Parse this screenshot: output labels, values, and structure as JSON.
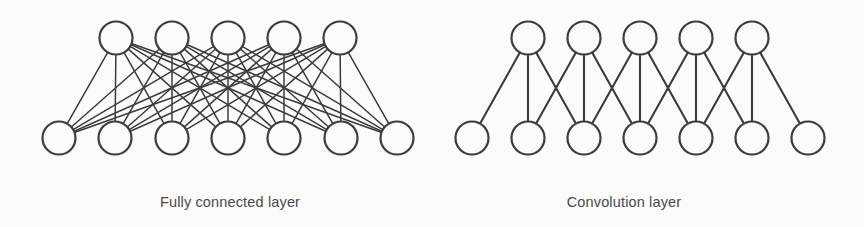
{
  "figure": {
    "background_color": "#fbfbfa",
    "stroke_color": "#3c3c3c",
    "node_fill": "#fbfbfa",
    "caption_color": "#4a4a4a",
    "width": 864,
    "height": 227
  },
  "diagrams": [
    {
      "id": "fully-connected",
      "caption": "Fully connected layer",
      "caption_x": 230,
      "connectivity": "all-to-all",
      "node_radius": 16.5,
      "edge_width": 1.5,
      "top_layer": {
        "count": 5,
        "y": 38,
        "x": [
          116,
          172,
          228,
          284,
          340
        ]
      },
      "bottom_layer": {
        "count": 7,
        "y": 138,
        "x": [
          59,
          115,
          172,
          228,
          284,
          341,
          397
        ]
      }
    },
    {
      "id": "convolution",
      "caption": "Convolution layer",
      "caption_x": 624,
      "connectivity": "local-receptive-field-3",
      "kernel_size": 3,
      "node_radius": 16.5,
      "edge_width": 2.1,
      "top_layer": {
        "count": 5,
        "y": 38,
        "x": [
          528,
          584,
          640,
          696,
          752
        ]
      },
      "bottom_layer": {
        "count": 7,
        "y": 138,
        "x": [
          472,
          528,
          584,
          640,
          696,
          752,
          808
        ]
      }
    }
  ]
}
